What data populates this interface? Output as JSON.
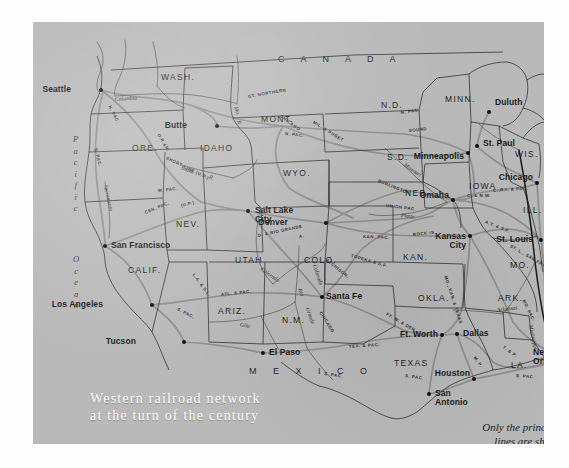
{
  "map": {
    "title_line1": "Western railroad network",
    "title_line2": "at the turn of the century",
    "caption_line1": "Only the principal",
    "caption_line2": "lines are shown",
    "background_color": "#b9b9b9",
    "title_color": "#ffffff",
    "ink_color": "#1b1b1b",
    "rail_line_color": "#8a8a8a",
    "border_color": "#2a2a2a"
  },
  "oceans": [
    {
      "name": "pacific",
      "text": "P a c i f i c",
      "x": 40,
      "y": 112
    },
    {
      "name": "ocean",
      "text": "O c e a n",
      "x": 40,
      "y": 232
    }
  ],
  "countries": [
    {
      "name": "canada",
      "label": "C A N A D A",
      "x": 245,
      "y": 33
    },
    {
      "name": "mexico",
      "label": "M E X I C O",
      "x": 216,
      "y": 345
    }
  ],
  "cities": [
    {
      "name": "seattle",
      "label": "Seattle",
      "dx": 68,
      "dy": 68,
      "lx": 38,
      "ly": 63,
      "align": "right"
    },
    {
      "name": "butte",
      "label": "Butte",
      "dx": 184,
      "dy": 104,
      "lx": 154,
      "ly": 99,
      "align": "right"
    },
    {
      "name": "salt-lake-city",
      "label": "Salt Lake\nCity",
      "dx": 215,
      "dy": 189,
      "lx": 222,
      "ly": 184,
      "align": "left"
    },
    {
      "name": "denver",
      "label": "Denver",
      "dx": 293,
      "dy": 201,
      "lx": 255,
      "ly": 196,
      "align": "right"
    },
    {
      "name": "san-francisco",
      "label": "San Francisco",
      "dx": 72,
      "dy": 224,
      "lx": 78,
      "ly": 219,
      "align": "left"
    },
    {
      "name": "los-angeles",
      "label": "Los Angeles",
      "dx": 119,
      "dy": 283,
      "lx": 70,
      "ly": 278,
      "align": "right"
    },
    {
      "name": "tucson",
      "label": "Tucson",
      "dx": 151,
      "dy": 320,
      "lx": 103,
      "ly": 315,
      "align": "right"
    },
    {
      "name": "el-paso",
      "label": "El Paso",
      "dx": 230,
      "dy": 331,
      "lx": 236,
      "ly": 326,
      "align": "left"
    },
    {
      "name": "santa-fe",
      "label": "Santa Fe",
      "dx": 289,
      "dy": 275,
      "lx": 293,
      "ly": 270,
      "align": "left"
    },
    {
      "name": "duluth",
      "label": "Duluth",
      "dx": 456,
      "dy": 90,
      "lx": 462,
      "ly": 76,
      "align": "left"
    },
    {
      "name": "st-paul",
      "label": "St. Paul",
      "dx": 444,
      "dy": 124,
      "lx": 450,
      "ly": 117,
      "align": "left"
    },
    {
      "name": "minneapolis",
      "label": "Minneapolis",
      "dx": 435,
      "dy": 131,
      "lx": 431,
      "ly": 130,
      "align": "right"
    },
    {
      "name": "chicago",
      "label": "Chicago",
      "dx": 504,
      "dy": 161,
      "lx": 500,
      "ly": 151,
      "align": "right"
    },
    {
      "name": "omaha",
      "label": "Omaha",
      "dx": 420,
      "dy": 178,
      "lx": 416,
      "ly": 169,
      "align": "right"
    },
    {
      "name": "kansas-city",
      "label": "Kansas\nCity",
      "dx": 437,
      "dy": 214,
      "lx": 433,
      "ly": 210,
      "align": "right"
    },
    {
      "name": "st-louis",
      "label": "St. Louis",
      "dx": 508,
      "dy": 218,
      "lx": 500,
      "ly": 213,
      "align": "right"
    },
    {
      "name": "ft-worth",
      "label": "Ft. Worth",
      "dx": 409,
      "dy": 313,
      "lx": 405,
      "ly": 308,
      "align": "right"
    },
    {
      "name": "dallas",
      "label": "Dallas",
      "dx": 424,
      "dy": 312,
      "lx": 430,
      "ly": 307,
      "align": "left"
    },
    {
      "name": "houston",
      "label": "Houston",
      "dx": 441,
      "dy": 357,
      "lx": 437,
      "ly": 347,
      "align": "right"
    },
    {
      "name": "san-antonio",
      "label": "San\nAntonio",
      "dx": 396,
      "dy": 372,
      "lx": 402,
      "ly": 367,
      "align": "left"
    },
    {
      "name": "new-orleans",
      "label": "New\nOrleans",
      "dx": 534,
      "dy": 337,
      "lx": 500,
      "ly": 326,
      "align": "left"
    }
  ],
  "states": [
    {
      "name": "wash",
      "label": "WASH.",
      "x": 128,
      "y": 51
    },
    {
      "name": "ore",
      "label": "ORE.",
      "x": 99,
      "y": 122
    },
    {
      "name": "idaho",
      "label": "IDAHO",
      "x": 167,
      "y": 122
    },
    {
      "name": "mont",
      "label": "MONT.",
      "x": 228,
      "y": 93
    },
    {
      "name": "wyo",
      "label": "WYO.",
      "x": 250,
      "y": 147
    },
    {
      "name": "nev",
      "label": "NEV.",
      "x": 143,
      "y": 198
    },
    {
      "name": "utah",
      "label": "UTAH",
      "x": 202,
      "y": 234
    },
    {
      "name": "colo",
      "label": "COLO.",
      "x": 271,
      "y": 234
    },
    {
      "name": "calif",
      "label": "CALIF.",
      "x": 95,
      "y": 244
    },
    {
      "name": "ariz",
      "label": "ARIZ.",
      "x": 185,
      "y": 285
    },
    {
      "name": "nm",
      "label": "N.M.",
      "x": 249,
      "y": 294
    },
    {
      "name": "nd",
      "label": "N.D.",
      "x": 348,
      "y": 79
    },
    {
      "name": "sd",
      "label": "S.D.",
      "x": 354,
      "y": 131
    },
    {
      "name": "minn",
      "label": "MINN.",
      "x": 412,
      "y": 73
    },
    {
      "name": "wis",
      "label": "WIS.",
      "x": 482,
      "y": 128
    },
    {
      "name": "neb",
      "label": "NEB.",
      "x": 372,
      "y": 167
    },
    {
      "name": "iowa",
      "label": "IOWA",
      "x": 436,
      "y": 160
    },
    {
      "name": "ill",
      "label": "ILL.",
      "x": 490,
      "y": 184
    },
    {
      "name": "kan",
      "label": "KAN.",
      "x": 370,
      "y": 231
    },
    {
      "name": "mo",
      "label": "MO.",
      "x": 477,
      "y": 239
    },
    {
      "name": "ark",
      "label": "ARK.",
      "x": 465,
      "y": 272
    },
    {
      "name": "okla",
      "label": "OKLA.",
      "x": 385,
      "y": 272
    },
    {
      "name": "texas",
      "label": "TEXAS",
      "x": 361,
      "y": 337
    },
    {
      "name": "la",
      "label": "LA.",
      "x": 478,
      "y": 339
    },
    {
      "name": "miss",
      "label": "MISS.",
      "x": 519,
      "y": 308
    }
  ],
  "railroads": [
    {
      "name": "n-pac-seattle",
      "label": "N. PAC.",
      "x": 76,
      "y": 82,
      "rot": 62
    },
    {
      "name": "s-pac-ore",
      "label": "S. PAC.",
      "x": 62,
      "y": 124,
      "rot": 75
    },
    {
      "name": "o-r-n",
      "label": "O.R.&N.",
      "x": 125,
      "y": 110,
      "rot": 60
    },
    {
      "name": "short-line-up",
      "label": "SHORT LINE (U.P.)",
      "x": 133,
      "y": 134,
      "rot": 26
    },
    {
      "name": "gt-northern",
      "label": "GT. NORTHERN",
      "x": 215,
      "y": 73,
      "rot": -10
    },
    {
      "name": "chicago",
      "label": "CHICAGO",
      "x": 247,
      "y": 92,
      "rot": 36
    },
    {
      "name": "n-pac-mont",
      "label": "N. PAC.",
      "x": 252,
      "y": 110,
      "rot": 6
    },
    {
      "name": "mil-puget",
      "label": "MIL. & PUGET",
      "x": 280,
      "y": 98,
      "rot": 32
    },
    {
      "name": "n-pac-nd",
      "label": "N. PAC.",
      "x": 368,
      "y": 89,
      "rot": -8
    },
    {
      "name": "sound",
      "label": "SOUND",
      "x": 376,
      "y": 107,
      "rot": -6
    },
    {
      "name": "burlington",
      "label": "BURLINGTON",
      "x": 345,
      "y": 157,
      "rot": 22
    },
    {
      "name": "union-pac",
      "label": "UNION  PAC.",
      "x": 353,
      "y": 182,
      "rot": 7
    },
    {
      "name": "w-pac",
      "label": "W. PAC.",
      "x": 125,
      "y": 167,
      "rot": -6
    },
    {
      "name": "cen-pac",
      "label": "CEN. PAC.",
      "x": 112,
      "y": 189,
      "rot": -22
    },
    {
      "name": "up-nev",
      "label": "(U.P.)",
      "x": 148,
      "y": 182,
      "rot": -14
    },
    {
      "name": "d-rio-grande",
      "label": "D. & RIO GRANDE",
      "x": 225,
      "y": 212,
      "rot": -12
    },
    {
      "name": "a-t-s-f-nm",
      "label": "A.",
      "x": 266,
      "y": 213,
      "rot": -10
    },
    {
      "name": "l-a-s-l",
      "label": "L.A. & S.L.",
      "x": 160,
      "y": 250,
      "rot": 54
    },
    {
      "name": "s-pac-la",
      "label": "S. PAC.",
      "x": 144,
      "y": 285,
      "rot": 28
    },
    {
      "name": "atl-pac",
      "label": "ATL. & PAC.",
      "x": 188,
      "y": 271,
      "rot": -6
    },
    {
      "name": "chicago-nm",
      "label": "CHICAGO",
      "x": 287,
      "y": 288,
      "rot": 58
    },
    {
      "name": "atchison",
      "label": "ATCHISON,",
      "x": 293,
      "y": 236,
      "rot": 38
    },
    {
      "name": "topeka-sf",
      "label": "TOPEKA & S.F.",
      "x": 318,
      "y": 232,
      "rot": 16
    },
    {
      "name": "kan-pac",
      "label": "KAN. PAC.",
      "x": 330,
      "y": 213,
      "rot": 2
    },
    {
      "name": "rock-is",
      "label": "ROCK IS.",
      "x": 380,
      "y": 211,
      "rot": -6
    },
    {
      "name": "c-nw",
      "label": "C. & N.W.",
      "x": 434,
      "y": 172,
      "rot": 0
    },
    {
      "name": "c-r-i-pac",
      "label": "C.,R.I. & PAC.",
      "x": 460,
      "y": 167,
      "rot": -4
    },
    {
      "name": "a-t-s-f",
      "label": "A.T. & S.F.",
      "x": 452,
      "y": 198,
      "rot": 22
    },
    {
      "name": "stl-san-fran",
      "label": "ST. L., SAN FRAN.",
      "x": 477,
      "y": 222,
      "rot": 30
    },
    {
      "name": "mo-kan-texas",
      "label": "MO., KAN. & TEXAS",
      "x": 412,
      "y": 252,
      "rot": 72
    },
    {
      "name": "ft-w-den",
      "label": "FT. W. & DEN.",
      "x": 353,
      "y": 290,
      "rot": 30
    },
    {
      "name": "tex-pac",
      "label": "TEX. & PAC.",
      "x": 316,
      "y": 323,
      "rot": -4
    },
    {
      "name": "s-pac-texas",
      "label": "S. PAC.",
      "x": 291,
      "y": 350,
      "rot": 8
    },
    {
      "name": "t-p-la",
      "label": "T. & P.",
      "x": 470,
      "y": 323,
      "rot": 36
    },
    {
      "name": "s-pac-la2",
      "label": "S. PAC.",
      "x": 483,
      "y": 352,
      "rot": 4
    },
    {
      "name": "mo-pac",
      "label": "MO. PAC.",
      "x": 490,
      "y": 276,
      "rot": 64
    },
    {
      "name": "cen-ill",
      "label": "CEN.",
      "x": 513,
      "y": 274,
      "rot": 72
    },
    {
      "name": "ill-cen",
      "label": "ILL.",
      "x": 521,
      "y": 294,
      "rot": 78
    },
    {
      "name": "k-p-texas",
      "label": "M. P.",
      "x": 441,
      "y": 333,
      "rot": 54
    },
    {
      "name": "s-pac-houston",
      "label": "S. PAC.",
      "x": 372,
      "y": 352,
      "rot": 8
    }
  ],
  "rivers": [
    {
      "name": "columbia",
      "label": "Columbia",
      "x": 82,
      "y": 75,
      "rot": -4
    },
    {
      "name": "snake",
      "label": "Snake",
      "x": 148,
      "y": 143,
      "rot": 22
    },
    {
      "name": "snake-r",
      "label": "R.",
      "x": 176,
      "y": 152,
      "rot": 30
    },
    {
      "name": "mo-r",
      "label": "Mo.",
      "x": 202,
      "y": 82,
      "rot": 70
    },
    {
      "name": "r-yellow",
      "label": "R.",
      "x": 205,
      "y": 96,
      "rot": 70
    },
    {
      "name": "sacramento",
      "label": "Sacramento",
      "x": 72,
      "y": 160,
      "rot": 78
    },
    {
      "name": "colorado-ut",
      "label": "Colorado",
      "x": 228,
      "y": 244,
      "rot": 36
    },
    {
      "name": "colorado-az",
      "label": "Colorado",
      "x": 281,
      "y": 240,
      "rot": 72
    },
    {
      "name": "gila",
      "label": "Gila",
      "x": 207,
      "y": 300,
      "rot": 12
    },
    {
      "name": "rio-grande",
      "label": "Rio",
      "x": 266,
      "y": 264,
      "rot": 70
    },
    {
      "name": "grande",
      "label": "Grande",
      "x": 274,
      "y": 283,
      "rot": 72
    },
    {
      "name": "missouri",
      "label": "Missouri",
      "x": 371,
      "y": 140,
      "rot": 34
    },
    {
      "name": "platte",
      "label": "Platte",
      "x": 368,
      "y": 191,
      "rot": 6
    },
    {
      "name": "arkansas",
      "label": "Arkansas",
      "x": 464,
      "y": 286,
      "rot": -8
    },
    {
      "name": "mississippi",
      "label": "Mississippi",
      "x": 497,
      "y": 300,
      "rot": 78
    }
  ]
}
